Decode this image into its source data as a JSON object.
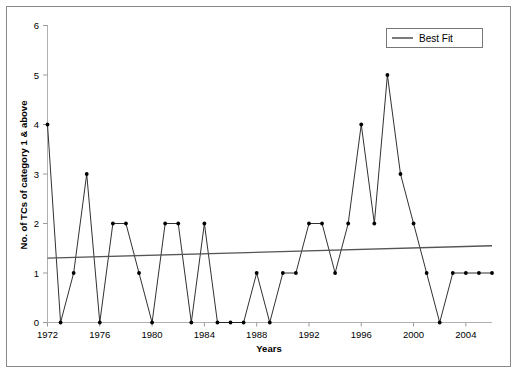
{
  "chart_data": {
    "type": "line",
    "title": "",
    "xlabel": "Years",
    "ylabel": "No. of TCs of category 1 & above",
    "xlim": [
      1972,
      2006
    ],
    "ylim": [
      0,
      6
    ],
    "grid": false,
    "legend_position": "top-right",
    "x_tick_labels": [
      "1972",
      "1976",
      "1980",
      "1984",
      "1988",
      "1992",
      "1996",
      "2000",
      "2004"
    ],
    "x_ticks": [
      1972,
      1976,
      1980,
      1984,
      1988,
      1992,
      1996,
      2000,
      2004
    ],
    "y_tick_labels": [
      "0",
      "1",
      "2",
      "3",
      "4",
      "5",
      "6"
    ],
    "y_ticks": [
      0,
      1,
      2,
      3,
      4,
      5,
      6
    ],
    "x": [
      1972,
      1973,
      1974,
      1975,
      1976,
      1977,
      1978,
      1979,
      1980,
      1981,
      1982,
      1983,
      1984,
      1985,
      1986,
      1987,
      1988,
      1989,
      1990,
      1991,
      1992,
      1993,
      1994,
      1995,
      1996,
      1997,
      1998,
      1999,
      2000,
      2001,
      2002,
      2003,
      2004,
      2005,
      2006
    ],
    "series": [
      {
        "name": "No. of TCs of category 1 & above",
        "values": [
          4,
          0,
          1,
          3,
          0,
          2,
          2,
          1,
          0,
          2,
          2,
          0,
          2,
          0,
          0,
          0,
          1,
          0,
          1,
          1,
          2,
          2,
          1,
          2,
          4,
          2,
          5,
          3,
          2,
          1,
          0,
          1,
          1,
          1,
          1
        ],
        "color": "#1a1a1a",
        "marker": "dot"
      },
      {
        "name": "Best Fit",
        "type": "trendline",
        "endpoints": [
          {
            "x": 1972,
            "y": 1.3
          },
          {
            "x": 2006,
            "y": 1.55
          }
        ],
        "color": "#555555"
      }
    ],
    "legend": [
      {
        "label": "Best Fit",
        "color": "#555555"
      }
    ]
  },
  "legend": {
    "best_fit_label": "Best Fit"
  },
  "axes": {
    "x_title": "Years",
    "y_title": "No. of TCs of category 1 & above"
  },
  "colors": {
    "series": "#1a1a1a",
    "trend": "#555555",
    "axis": "#b0b0b0",
    "frame": "#8a8a8a",
    "background": "#ffffff"
  }
}
